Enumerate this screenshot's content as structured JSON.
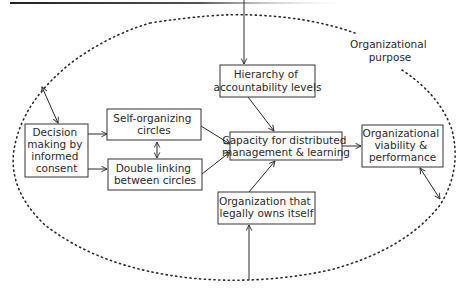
{
  "diagram": {
    "boundary": {
      "label_line1": "Organizational",
      "label_line2": "purpose"
    },
    "nodes": {
      "decision": {
        "lines": [
          "Decision",
          "making by",
          "informed",
          "consent"
        ]
      },
      "self_org": {
        "lines": [
          "Self-organizing",
          "circles"
        ]
      },
      "double_link": {
        "lines": [
          "Double linking",
          "between circles"
        ]
      },
      "hierarchy": {
        "lines": [
          "Hierarchy of",
          "accountability levels"
        ]
      },
      "capacity": {
        "lines": [
          "Capacity for distributed",
          "management & learning"
        ]
      },
      "viability": {
        "lines": [
          "Organizational",
          "viability &",
          "performance"
        ]
      },
      "owns_itself": {
        "lines": [
          "Organization that",
          "legally owns itself"
        ]
      }
    },
    "edges": [
      {
        "from": "external-top",
        "to": "hierarchy",
        "type": "arrow"
      },
      {
        "from": "boundary",
        "to": "decision",
        "type": "double-arrow"
      },
      {
        "from": "decision",
        "to": "self_org",
        "type": "arrow"
      },
      {
        "from": "decision",
        "to": "double_link",
        "type": "arrow"
      },
      {
        "from": "self_org",
        "to": "double_link",
        "type": "double-arrow"
      },
      {
        "from": "self_org",
        "to": "capacity",
        "type": "arrow"
      },
      {
        "from": "double_link",
        "to": "capacity",
        "type": "arrow"
      },
      {
        "from": "hierarchy",
        "to": "capacity",
        "type": "arrow"
      },
      {
        "from": "owns_itself",
        "to": "capacity",
        "type": "arrow"
      },
      {
        "from": "external-bottom",
        "to": "owns_itself",
        "type": "arrow"
      },
      {
        "from": "capacity",
        "to": "viability",
        "type": "arrow"
      },
      {
        "from": "viability",
        "to": "boundary",
        "type": "double-arrow"
      }
    ],
    "colors": {
      "stroke": "#2a2a2a",
      "background": "#ffffff"
    }
  }
}
